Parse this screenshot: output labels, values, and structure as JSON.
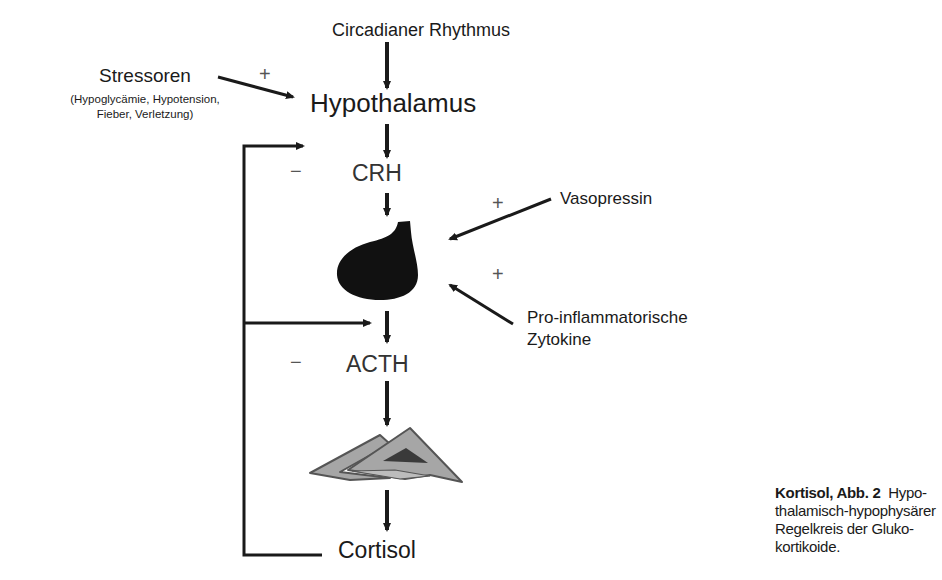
{
  "diagram": {
    "nodes": {
      "circadian": "Circadianer Rhythmus",
      "stressors": "Stressoren",
      "stressors_detail_line1": "(Hypoglycämie, Hypotension,",
      "stressors_detail_line2": "Fieber, Verletzung)",
      "hypothalamus": "Hypothalamus",
      "crh": "CRH",
      "pituitary": "pituitary-gland-shape",
      "vasopressin": "Vasopressin",
      "cytokines_line1": "Pro-inflammatorische",
      "cytokines_line2": "Zytokine",
      "acth": "ACTH",
      "adrenal": "adrenal-gland-shape",
      "cortisol": "Cortisol"
    },
    "signs": {
      "stressors_to_hypothalamus": "+",
      "feedback_crh": "−",
      "vasopressin_to_pituitary": "+",
      "cytokines_to_pituitary": "+",
      "feedback_acth": "−"
    },
    "edges": [
      {
        "from": "Circadianer Rhythmus",
        "to": "Hypothalamus",
        "type": "stimulate"
      },
      {
        "from": "Stressoren",
        "to": "Hypothalamus",
        "type": "stimulate",
        "sign": "+"
      },
      {
        "from": "Hypothalamus",
        "to": "CRH"
      },
      {
        "from": "CRH",
        "to": "Hypophyse"
      },
      {
        "from": "Vasopressin",
        "to": "Hypophyse",
        "sign": "+"
      },
      {
        "from": "Pro-inflammatorische Zytokine",
        "to": "Hypophyse",
        "sign": "+"
      },
      {
        "from": "Hypophyse",
        "to": "ACTH"
      },
      {
        "from": "ACTH",
        "to": "Nebenniere"
      },
      {
        "from": "Nebenniere",
        "to": "Cortisol"
      },
      {
        "from": "Cortisol",
        "to": "CRH",
        "type": "inhibit",
        "sign": "−"
      },
      {
        "from": "Cortisol",
        "to": "ACTH",
        "type": "inhibit",
        "sign": "−"
      }
    ],
    "colors": {
      "text": "#1a1a1a",
      "pituitary_fill": "#111111",
      "adrenal_fill": "#a6a6a6",
      "adrenal_stroke": "#555555",
      "adrenal_inner": "#3a3a3a"
    }
  },
  "caption": {
    "bold": "Kortisol, Abb. 2",
    "text": "Hypo­thalamisch-hypophysärer Regelkreis der Gluko­kortikoide."
  }
}
